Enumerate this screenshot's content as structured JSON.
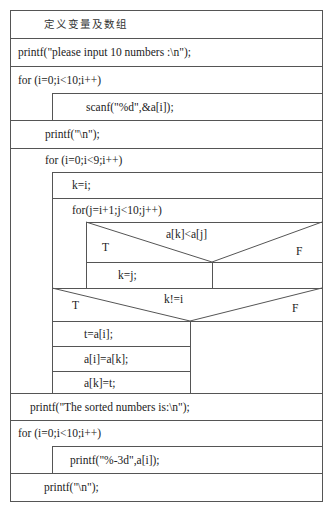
{
  "title": "定义变量及数组",
  "statements": {
    "prompt": "printf(\"please input 10 numbers :\\n\");",
    "loop1": "for (i=0;i<10;i++)",
    "scanf": "scanf(\"%d\",&a[i]);",
    "newline1": "printf(\"\\n\");",
    "outer_loop": "for (i=0;i<9;i++)",
    "k_assign": "k=i;",
    "inner_loop": "for(j=i+1;j<10;j++)",
    "cond1": "a[k]<a[j]",
    "cond1_true": "T",
    "cond1_false": "F",
    "k_j": "k=j;",
    "cond2": "k!=i",
    "cond2_true": "T",
    "cond2_false": "F",
    "swap1": "t=a[i];",
    "swap2": "a[i]=a[k];",
    "swap3": "a[k]=t;",
    "sorted_msg": "printf(\"The sorted numbers is:\\n\");",
    "loop3": "for (i=0;i<10;i++)",
    "print_elem": "printf(\"%-3d\",a[i]);",
    "newline2": "printf(\"\\n\");"
  },
  "colors": {
    "line": "#555555",
    "text": "#222222",
    "background": "#ffffff"
  }
}
